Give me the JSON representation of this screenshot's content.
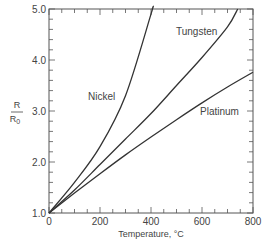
{
  "chart_data": {
    "type": "line",
    "title": "",
    "xlabel": "Temperature, °C",
    "ylabel_num": "R",
    "ylabel_den": "R0",
    "xlim": [
      0,
      800
    ],
    "ylim": [
      1.0,
      5.0
    ],
    "xticks": [
      "0",
      "200",
      "400",
      "600",
      "800"
    ],
    "yticks": [
      "1.0",
      "2.0",
      "3.0",
      "4.0",
      "5.0"
    ],
    "grid": false,
    "legend": "inline labels",
    "series": [
      {
        "name": "Nickel",
        "x": [
          0,
          100,
          200,
          300,
          400,
          405
        ],
        "y": [
          1.0,
          1.6,
          2.3,
          3.3,
          4.9,
          5.0
        ]
      },
      {
        "name": "Tungsten",
        "x": [
          0,
          100,
          200,
          300,
          400,
          500,
          600,
          700,
          740
        ],
        "y": [
          1.0,
          1.45,
          1.95,
          2.45,
          2.95,
          3.5,
          4.05,
          4.65,
          5.0
        ]
      },
      {
        "name": "Platinum",
        "x": [
          0,
          100,
          200,
          300,
          400,
          500,
          600,
          700,
          800
        ],
        "y": [
          1.0,
          1.39,
          1.77,
          2.14,
          2.49,
          2.83,
          3.16,
          3.47,
          3.76
        ]
      }
    ]
  }
}
